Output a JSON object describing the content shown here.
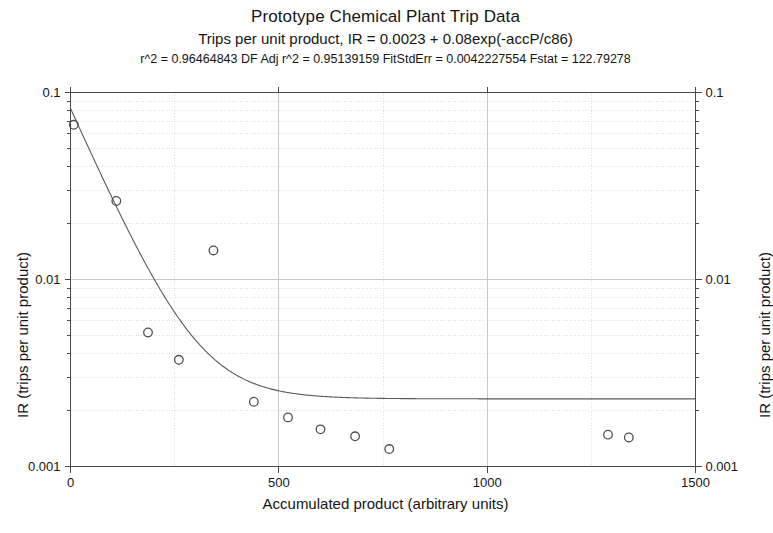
{
  "chart_data": {
    "type": "scatter",
    "title": "Prototype Chemical Plant Trip Data",
    "subtitle": "Trips per unit product, IR = 0.0023 + 0.08exp(-accP/c86)",
    "stats": "r^2 = 0.96464843  DF  Adj r^2 = 0.95139159  FitStdErr = 0.0042227554  Fstat = 122.79278",
    "xlabel": "Accumulated product (arbitrary units)",
    "ylabel": "IR (trips per unit product)",
    "ylabel_right": "IR (trips per unit product)",
    "xscale": "linear",
    "yscale": "log",
    "xlim": [
      0,
      1500
    ],
    "ylim": [
      0.001,
      0.1
    ],
    "xticks": [
      0,
      500,
      1000,
      1500
    ],
    "xtick_labels": [
      "0",
      "500",
      "1000",
      "1500"
    ],
    "yticks": [
      0.001,
      0.01,
      0.1
    ],
    "ytick_labels": [
      "0.001",
      "0.01",
      "0.1"
    ],
    "grid": true,
    "grid_minor": true,
    "grid_x_spacing": 250,
    "legend": "none",
    "marker": "open-circle",
    "series": [
      {
        "name": "Observed IR",
        "x": [
          8,
          110,
          186,
          260,
          343,
          440,
          522,
          600,
          683,
          765,
          1290,
          1340
        ],
        "y": [
          0.0672,
          0.0263,
          0.00521,
          0.00372,
          0.0143,
          0.00222,
          0.00183,
          0.00158,
          0.00145,
          0.00124,
          0.00148,
          0.00143
        ]
      }
    ],
    "fit": {
      "name": "Fitted curve",
      "equation": "IR = 0.0023 + 0.08exp(-accP/c86)",
      "asymptote": 0.0023,
      "amplitude": 0.08,
      "decay_constant": 86,
      "r_squared": 0.96464843,
      "adj_r_squared": 0.95139159,
      "fit_std_err": 0.0042227554,
      "fstat": 122.79278
    }
  },
  "colors": {
    "axis": "#4a4a4a",
    "grid_major": "#c8c8c8",
    "grid_minor": "#dedede",
    "marker": "#4f4f4f",
    "curve": "#5a5a5a",
    "text": "#151515",
    "background": "#ffffff"
  }
}
